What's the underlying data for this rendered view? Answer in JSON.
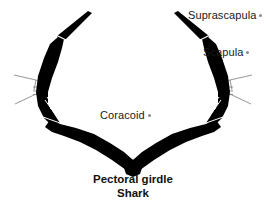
{
  "figure": {
    "background_color": "#ffffff",
    "silhouette_color": "#000000",
    "leader_line_color": "#7a7a7a",
    "suture_color": "#ffffff",
    "label_color": "#1a1a1a",
    "width": 266,
    "height": 210
  },
  "labels": {
    "suprascapula": "Suprascapula",
    "scapula": "Scapula",
    "coracoid": "Coracoid"
  },
  "caption": {
    "line1": "Pectoral girdle",
    "line2": "Shark"
  }
}
